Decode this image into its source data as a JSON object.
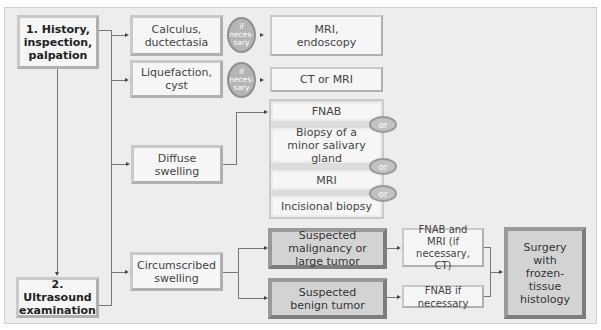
{
  "diagram": {
    "steps": {
      "history": "1. History, inspection, palpation",
      "ultrasound": "2. Ultrasound examination"
    },
    "findings": {
      "calculus": "Calculus, ductectasia",
      "liquefaction": "Liquefaction, cyst",
      "diffuse": "Diffuse swelling",
      "circumscribed": "Circumscribed swelling"
    },
    "conditionals": {
      "if_necessary_1": "if neces- sary",
      "if_necessary_2": "if neces- sary"
    },
    "tests": {
      "mri_endoscopy": "MRI, endoscopy",
      "ct_or_mri": "CT or MRI",
      "fnab": "FNAB",
      "biopsy_minor": "Biopsy of a minor salivary gland",
      "mri": "MRI",
      "incisional": "Incisional biopsy",
      "fnab_and_mri": "FNAB and MRI (if necessary, CT)",
      "fnab_if_necessary": "FNAB if necessary"
    },
    "or_labels": [
      "or",
      "or",
      "or"
    ],
    "suspicions": {
      "malignancy": "Suspected malignancy or large tumor",
      "benign": "Suspected benign tumor"
    },
    "outcome": "Surgery with frozen-tissue histology"
  }
}
